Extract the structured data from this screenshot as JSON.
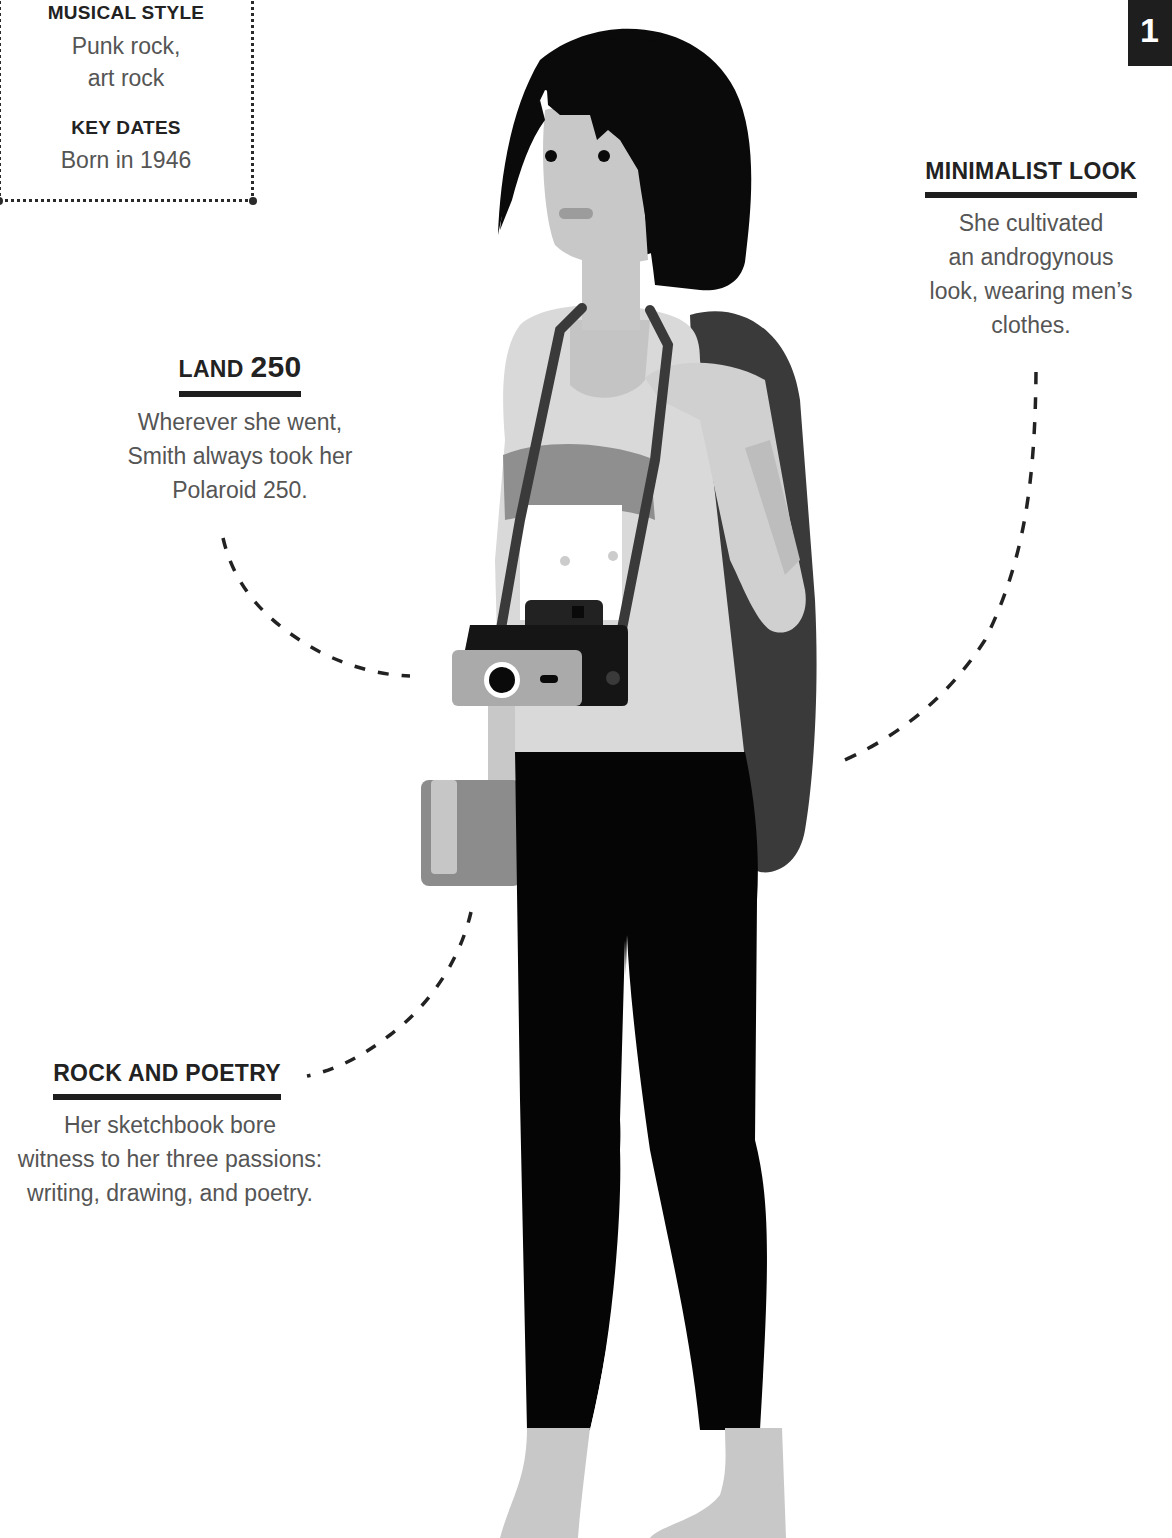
{
  "info_box": {
    "musical_style_label": "MUSICAL STYLE",
    "musical_style_value_line1": "Punk rock,",
    "musical_style_value_line2": "art rock",
    "key_dates_label": "KEY DATES",
    "key_dates_value": "Born in 1946"
  },
  "page_tab": {
    "number": "1"
  },
  "callouts": {
    "minimalist_look": {
      "title": "MINIMALIST LOOK",
      "body_lines": [
        "She cultivated",
        "an androgynous",
        "look, wearing men’s",
        "clothes."
      ]
    },
    "land_250": {
      "title_small": "LAND",
      "title_big": "250",
      "body_lines": [
        "Wherever she went,",
        "Smith always took her",
        "Polaroid 250."
      ]
    },
    "rock_and_poetry": {
      "title": "ROCK AND POETRY",
      "body_lines": [
        "Her sketchbook bore",
        "witness to her three passions:",
        "writing, drawing, and poetry."
      ]
    }
  },
  "illustration": {
    "subject": "woman with bob haircut, camera strap, backpack, book",
    "icons": [
      "polaroid-camera-icon",
      "sketchbook-icon",
      "backpack-icon"
    ],
    "colors": {
      "hair": "#0a0a0a",
      "skin": "#c8c8c8",
      "shirt": "#d9d9d9",
      "shirt_band": "#8f8f8f",
      "pants": "#050505",
      "backpack": "#3a3a3a",
      "camera_body": "#151515",
      "camera_front": "#aaaaaa",
      "book": "#8c8c8c",
      "dashes": "#222222"
    }
  }
}
